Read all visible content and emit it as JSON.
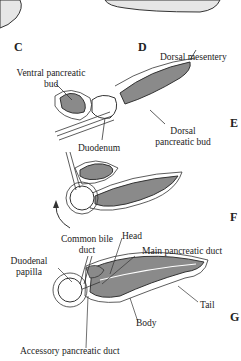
{
  "figure": {
    "panels": [
      "C",
      "D",
      "E",
      "F",
      "G"
    ],
    "labels": {
      "dorsal_mesentery": "Dorsal mesentery",
      "ventral_pancreatic_bud_1": "Ventral pancreatic",
      "ventral_pancreatic_bud_2": "bud",
      "duodenum": "Duodenum",
      "dorsal_pancreatic_bud_1": "Dorsal",
      "dorsal_pancreatic_bud_2": "pancreatic bud",
      "common_bile_duct_1": "Common bile",
      "common_bile_duct_2": "duct",
      "head": "Head",
      "main_pancreatic_duct": "Main pancreatic duct",
      "duodenal_papilla_1": "Duodenal",
      "duodenal_papilla_2": "papilla",
      "tail": "Tail",
      "body": "Body",
      "accessory_pancreatic_duct": "Accessory pancreatic duct"
    },
    "colors": {
      "tissue": "#8a8a8a",
      "stipple": "#e6e6e6",
      "line": "#333333"
    }
  }
}
